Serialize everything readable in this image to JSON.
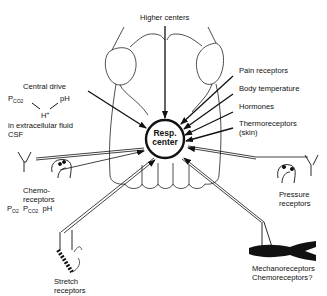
{
  "diagram": {
    "center": {
      "line1": "Resp.",
      "line2": "center"
    },
    "higher_centers": "Higher centers",
    "central_drive": {
      "title": "Central drive",
      "pco2": "P",
      "pco2_sub": "CO2",
      "ph": "pH",
      "h": "H",
      "h_sup": "+",
      "line3": "in extracellular fluid",
      "line4": "CSF"
    },
    "right_inputs": [
      "Pain receptors",
      "Body temperature",
      "Hormones",
      "Thermoreceptors",
      "(skin)"
    ],
    "chemoreceptors": {
      "line1": "Chemo-",
      "line2": "receptors",
      "po2": "P",
      "po2_sub": "O2",
      "pco2": "P",
      "pco2_sub": "CO2",
      "ph": "pH"
    },
    "pressure_receptors": {
      "line1": "Pressure",
      "line2": "receptors"
    },
    "stretch_receptors": {
      "line1": "Stretch",
      "line2": "receptors"
    },
    "muscle_receptors": {
      "line1": "Mechanoreceptors",
      "line2": "Chemoreceptors?"
    }
  }
}
